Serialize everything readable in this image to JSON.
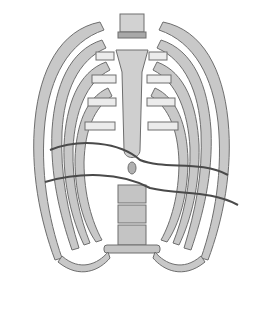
{
  "image": {
    "subject": "Anterior view of human rib cage with diaphragm outline",
    "style": "grayscale illustration",
    "colors": {
      "background": "#ffffff",
      "bone": "#c8c8c8",
      "bone_light": "#dcdcdc",
      "cartilage": "#ececec",
      "outline": "#6e6e6e",
      "diaphragm_line": "#4a4a4a"
    }
  }
}
